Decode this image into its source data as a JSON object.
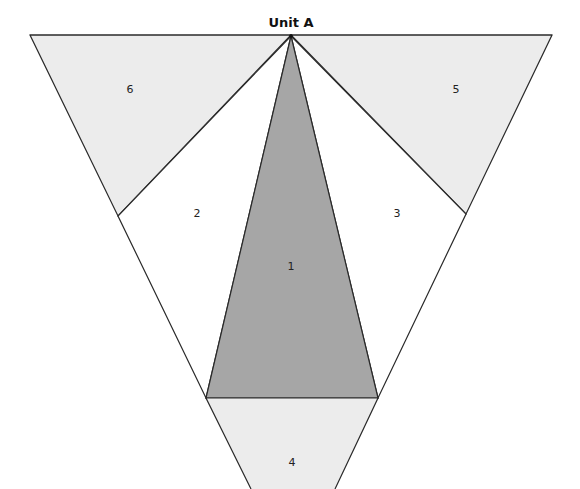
{
  "title": "Unit A",
  "colors": {
    "background": "#ffffff",
    "light_fill": "#ececec",
    "dark_fill": "#a6a6a6",
    "white_fill": "#ffffff",
    "stroke": "#2a2a2a"
  },
  "pieces": [
    {
      "id": "1",
      "label": "1",
      "fill": "dark"
    },
    {
      "id": "2",
      "label": "2",
      "fill": "white"
    },
    {
      "id": "3",
      "label": "3",
      "fill": "white"
    },
    {
      "id": "4",
      "label": "4",
      "fill": "light"
    },
    {
      "id": "5",
      "label": "5",
      "fill": "light"
    },
    {
      "id": "6",
      "label": "6",
      "fill": "light"
    }
  ]
}
